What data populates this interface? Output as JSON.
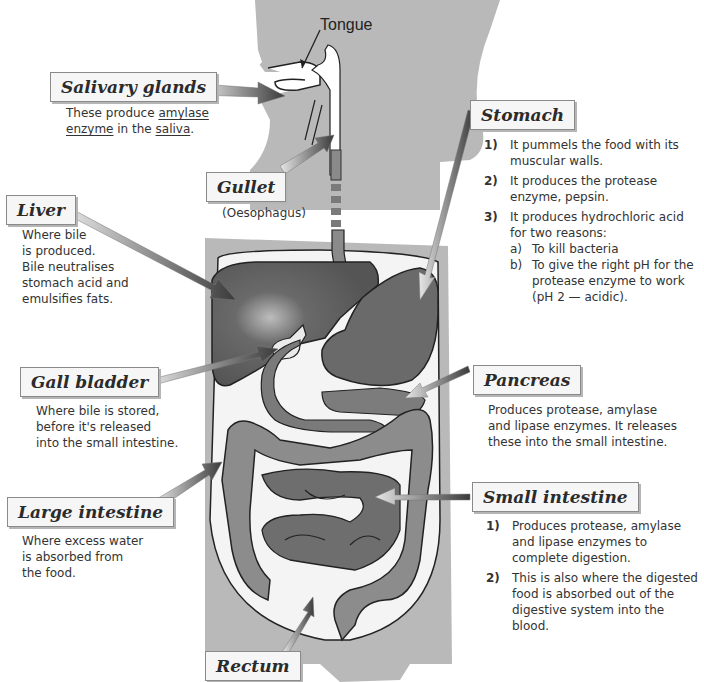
{
  "diagram": {
    "organs": {
      "tongue": {
        "label": "Tongue"
      },
      "salivary_glands": {
        "label": "Salivary glands",
        "desc_parts": [
          "These produce ",
          "amylase",
          " ",
          "enzyme",
          " in the ",
          "saliva",
          "."
        ]
      },
      "gullet": {
        "label": "Gullet",
        "sublabel": "(Oesophagus)"
      },
      "liver": {
        "label": "Liver",
        "desc_lines": [
          "Where bile",
          "is produced.",
          "Bile neutralises",
          "stomach acid and",
          "emulsifies fats."
        ]
      },
      "stomach": {
        "label": "Stomach",
        "points": [
          {
            "num": "1)",
            "text": "It pummels the food with its muscular walls."
          },
          {
            "num": "2)",
            "text": "It produces the protease enzyme, pepsin."
          },
          {
            "num": "3)",
            "text": "It produces hydrochloric acid for two reasons:"
          }
        ],
        "subpoints": [
          {
            "num": "a)",
            "text": "To kill bacteria"
          },
          {
            "num": "b)",
            "text": "To give the right pH for the protease enzyme to work (pH 2 — acidic)."
          }
        ]
      },
      "gall_bladder": {
        "label": "Gall bladder",
        "desc_lines": [
          "Where bile is stored,",
          "before it's released",
          "into the small intestine."
        ]
      },
      "pancreas": {
        "label": "Pancreas",
        "desc_lines": [
          "Produces protease, amylase",
          "and lipase enzymes.  It releases",
          "these into the small intestine."
        ]
      },
      "large_intestine": {
        "label": "Large intestine",
        "desc_lines": [
          "Where excess water",
          "is absorbed from",
          "the food."
        ]
      },
      "small_intestine": {
        "label": "Small intestine",
        "points": [
          {
            "num": "1)",
            "text": "Produces protease, amylase and lipase enzymes to complete digestion."
          },
          {
            "num": "2)",
            "text": "This is also where the digested food is absorbed out of the digestive system into the blood."
          }
        ]
      },
      "rectum": {
        "label": "Rectum"
      }
    },
    "colors": {
      "body_silhouette": "#b9b9b9",
      "cavity": "#f4f4f4",
      "liver": "#5e5e5e",
      "stomach": "#6a6a6a",
      "intestine": "#8c8c8c",
      "small_intestine": "#787878",
      "gullet": "#8a8a8a",
      "outline": "#222222",
      "label_bg": "#f6f6f6"
    }
  }
}
